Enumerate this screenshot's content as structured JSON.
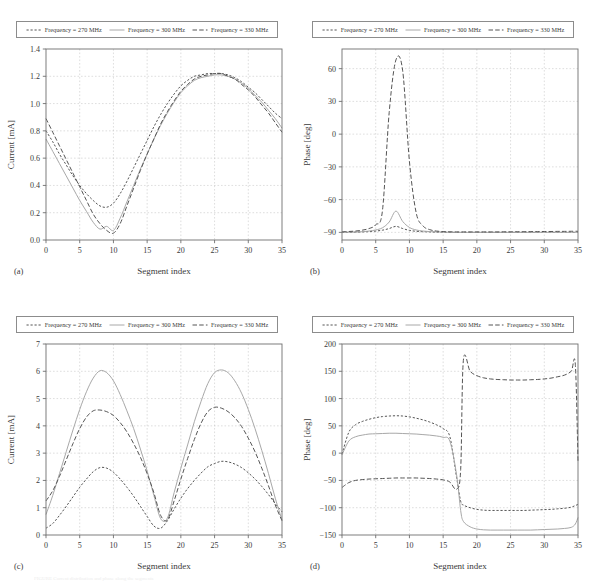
{
  "figure": {
    "panels": [
      {
        "id": "a",
        "caption": "(a)",
        "xlabel": "Segment index",
        "ylabel": "Current [mA]"
      },
      {
        "id": "b",
        "caption": "(b)",
        "xlabel": "Segment index",
        "ylabel": "Phase [deg]"
      },
      {
        "id": "c",
        "caption": "(c)",
        "xlabel": "Segment index",
        "ylabel": "Current [mA]"
      },
      {
        "id": "d",
        "caption": "(d)",
        "xlabel": "Segment index",
        "ylabel": "Phase [deg]"
      }
    ],
    "legend": {
      "entries": [
        {
          "label": "Frequency = 270 MHz",
          "style": "dotted",
          "color": "#555555"
        },
        {
          "label": "Frequency = 300 MHz",
          "style": "solid",
          "color": "#a8a8a8"
        },
        {
          "label": "Frequency = 330 MHz",
          "style": "dashdotted",
          "color": "#555555"
        }
      ]
    },
    "bottom_caption_partial": "FIGURE  Current distribution and phase along the segments"
  },
  "chart_data": [
    {
      "type": "line",
      "panel": "a",
      "title": "",
      "xlabel": "Segment index",
      "ylabel": "Current [mA]",
      "xlim": [
        0,
        35
      ],
      "ylim": [
        0.0,
        1.4
      ],
      "xticks": [
        0,
        5,
        10,
        15,
        20,
        25,
        30,
        35
      ],
      "yticks": [
        0.0,
        0.2,
        0.4,
        0.6,
        0.8,
        1.0,
        1.2,
        1.4
      ],
      "ytick_labels": [
        "0.0",
        "0.2",
        "0.4",
        "0.6",
        "0.8",
        "1.0",
        "1.2",
        "1.4"
      ],
      "grid": true,
      "legend_position": "above",
      "x": [
        0,
        1,
        2,
        3,
        4,
        5,
        6,
        7,
        8,
        9,
        10,
        11,
        12,
        13,
        14,
        15,
        16,
        17,
        18,
        19,
        20,
        21,
        22,
        23,
        24,
        25,
        26,
        27,
        28,
        29,
        30,
        31,
        32,
        33,
        34,
        35
      ],
      "series": [
        {
          "name": "Frequency = 270 MHz",
          "style": "dotted",
          "color": "#555555",
          "values": [
            0.8,
            0.72,
            0.63,
            0.55,
            0.47,
            0.4,
            0.34,
            0.29,
            0.25,
            0.24,
            0.27,
            0.34,
            0.43,
            0.53,
            0.63,
            0.73,
            0.83,
            0.92,
            1.0,
            1.07,
            1.13,
            1.17,
            1.2,
            1.21,
            1.22,
            1.22,
            1.22,
            1.21,
            1.19,
            1.16,
            1.12,
            1.08,
            1.03,
            0.98,
            0.93,
            0.89
          ]
        },
        {
          "name": "Frequency = 300 MHz",
          "style": "solid",
          "color": "#a8a8a8",
          "values": [
            0.74,
            0.65,
            0.56,
            0.47,
            0.38,
            0.29,
            0.21,
            0.13,
            0.08,
            0.1,
            0.07,
            0.16,
            0.28,
            0.4,
            0.52,
            0.63,
            0.74,
            0.84,
            0.93,
            1.01,
            1.08,
            1.13,
            1.17,
            1.19,
            1.2,
            1.21,
            1.21,
            1.2,
            1.18,
            1.15,
            1.11,
            1.06,
            1.01,
            0.95,
            0.89,
            0.82
          ]
        },
        {
          "name": "Frequency = 330 MHz",
          "style": "dashdotted",
          "color": "#555555",
          "values": [
            0.89,
            0.79,
            0.69,
            0.59,
            0.49,
            0.39,
            0.29,
            0.19,
            0.12,
            0.07,
            0.05,
            0.12,
            0.25,
            0.38,
            0.51,
            0.63,
            0.74,
            0.85,
            0.94,
            1.02,
            1.09,
            1.14,
            1.18,
            1.2,
            1.21,
            1.22,
            1.22,
            1.2,
            1.18,
            1.14,
            1.1,
            1.05,
            0.99,
            0.93,
            0.86,
            0.79
          ]
        }
      ]
    },
    {
      "type": "line",
      "panel": "b",
      "title": "",
      "xlabel": "Segment index",
      "ylabel": "Phase [deg]",
      "xlim": [
        0,
        35
      ],
      "ylim": [
        -97,
        78
      ],
      "xticks": [
        0,
        5,
        10,
        15,
        20,
        25,
        30,
        35
      ],
      "yticks": [
        -90,
        -60,
        -30,
        0,
        30,
        60
      ],
      "ytick_labels": [
        "−90",
        "−60",
        "−30",
        "0",
        "30",
        "60"
      ],
      "grid": true,
      "legend_position": "above",
      "x": [
        0,
        1,
        2,
        3,
        4,
        5,
        6,
        7,
        8,
        9,
        10,
        11,
        12,
        13,
        14,
        15,
        16,
        17,
        18,
        19,
        20,
        21,
        22,
        23,
        24,
        25,
        26,
        27,
        28,
        29,
        30,
        31,
        32,
        33,
        34,
        35
      ],
      "series": [
        {
          "name": "Frequency = 270 MHz",
          "style": "dotted",
          "color": "#555555",
          "values": [
            -90.0,
            -90.0,
            -89.8,
            -89.6,
            -89.3,
            -88.8,
            -88.0,
            -86.5,
            -84.5,
            -86.5,
            -88.2,
            -89.0,
            -89.4,
            -89.6,
            -89.8,
            -89.9,
            -90.0,
            -90.0,
            -90.0,
            -90.0,
            -90.0,
            -90.0,
            -90.0,
            -90.0,
            -90.0,
            -90.0,
            -90.0,
            -90.0,
            -90.0,
            -90.0,
            -90.0,
            -90.0,
            -90.0,
            -90.0,
            -90.0,
            -90.0
          ]
        },
        {
          "name": "Frequency = 300 MHz",
          "style": "solid",
          "color": "#a8a8a8",
          "values": [
            -90.0,
            -89.9,
            -89.7,
            -89.4,
            -88.8,
            -87.8,
            -85.8,
            -80.5,
            -70.5,
            -80.0,
            -85.5,
            -87.8,
            -88.8,
            -89.3,
            -89.6,
            -89.8,
            -89.9,
            -90.0,
            -90.0,
            -90.0,
            -90.0,
            -90.0,
            -90.0,
            -90.0,
            -90.0,
            -90.0,
            -90.0,
            -90.0,
            -90.0,
            -90.0,
            -90.0,
            -90.0,
            -90.0,
            -90.0,
            -90.0,
            -90.0
          ]
        },
        {
          "name": "Frequency = 330 MHz",
          "style": "dashdotted",
          "color": "#555555",
          "values": [
            -89.5,
            -89.2,
            -88.8,
            -88.0,
            -86.5,
            -83.0,
            -70.0,
            20.0,
            68.0,
            58.0,
            -25.0,
            -72.0,
            -84.0,
            -87.5,
            -88.8,
            -89.3,
            -89.5,
            -89.6,
            -89.6,
            -89.6,
            -89.6,
            -89.6,
            -89.6,
            -89.6,
            -89.5,
            -89.5,
            -89.4,
            -89.4,
            -89.3,
            -89.3,
            -89.2,
            -89.2,
            -89.1,
            -89.1,
            -89.0,
            -89.0
          ]
        }
      ]
    },
    {
      "type": "line",
      "panel": "c",
      "title": "",
      "xlabel": "Segment index",
      "ylabel": "Current [mA]",
      "xlim": [
        0,
        35
      ],
      "ylim": [
        0,
        7
      ],
      "xticks": [
        0,
        5,
        10,
        15,
        20,
        25,
        30,
        35
      ],
      "yticks": [
        0,
        1,
        2,
        3,
        4,
        5,
        6,
        7
      ],
      "ytick_labels": [
        "0",
        "1",
        "2",
        "3",
        "4",
        "5",
        "6",
        "7"
      ],
      "grid": true,
      "legend_position": "above",
      "x": [
        0,
        1,
        2,
        3,
        4,
        5,
        6,
        7,
        8,
        9,
        10,
        11,
        12,
        13,
        14,
        15,
        16,
        17,
        18,
        19,
        20,
        21,
        22,
        23,
        24,
        25,
        26,
        27,
        28,
        29,
        30,
        31,
        32,
        33,
        34,
        35
      ],
      "series": [
        {
          "name": "Frequency = 270 MHz",
          "style": "dotted",
          "color": "#555555",
          "values": [
            0.25,
            0.42,
            0.72,
            1.05,
            1.4,
            1.75,
            2.05,
            2.32,
            2.47,
            2.45,
            2.3,
            2.05,
            1.75,
            1.42,
            1.05,
            0.68,
            0.33,
            0.25,
            0.52,
            0.95,
            1.35,
            1.7,
            2.0,
            2.27,
            2.5,
            2.62,
            2.7,
            2.68,
            2.6,
            2.47,
            2.28,
            2.05,
            1.78,
            1.48,
            1.15,
            0.85
          ]
        },
        {
          "name": "Frequency = 300 MHz",
          "style": "solid",
          "color": "#a8a8a8",
          "values": [
            0.75,
            1.45,
            2.25,
            3.05,
            3.85,
            4.6,
            5.25,
            5.75,
            6.02,
            5.95,
            5.65,
            5.15,
            4.55,
            3.9,
            3.15,
            2.35,
            1.45,
            0.6,
            0.62,
            1.55,
            2.45,
            3.3,
            4.15,
            4.9,
            5.55,
            5.95,
            6.05,
            5.95,
            5.65,
            5.2,
            4.6,
            3.9,
            3.1,
            2.25,
            1.35,
            0.55
          ]
        },
        {
          "name": "Frequency = 330 MHz",
          "style": "dashdotted",
          "color": "#555555",
          "values": [
            1.25,
            1.62,
            2.15,
            2.75,
            3.35,
            3.9,
            4.32,
            4.55,
            4.58,
            4.52,
            4.38,
            4.12,
            3.78,
            3.35,
            2.85,
            2.25,
            1.55,
            0.72,
            0.55,
            1.25,
            2.05,
            2.8,
            3.5,
            4.1,
            4.52,
            4.68,
            4.65,
            4.52,
            4.3,
            3.98,
            3.55,
            3.05,
            2.45,
            1.8,
            1.1,
            0.52
          ]
        }
      ]
    },
    {
      "type": "line",
      "panel": "d",
      "title": "",
      "xlabel": "Segment index",
      "ylabel": "Phase [deg]",
      "xlim": [
        0,
        35
      ],
      "ylim": [
        -150,
        200
      ],
      "xticks": [
        0,
        5,
        10,
        15,
        20,
        25,
        30,
        35
      ],
      "yticks": [
        -150,
        -100,
        -50,
        0,
        50,
        100,
        150,
        200
      ],
      "ytick_labels": [
        "−150",
        "−100",
        "−50",
        "0",
        "50",
        "100",
        "150",
        "200"
      ],
      "grid": true,
      "legend_position": "above",
      "x": [
        0,
        1,
        2,
        3,
        4,
        5,
        6,
        7,
        8,
        9,
        10,
        11,
        12,
        13,
        14,
        15,
        16,
        17,
        17.6,
        18,
        19,
        20,
        21,
        22,
        23,
        24,
        25,
        26,
        27,
        28,
        29,
        30,
        31,
        32,
        33,
        34,
        34.6,
        35
      ],
      "series": [
        {
          "name": "Frequency = 270 MHz",
          "style": "dotted",
          "color": "#555555",
          "values": [
            -2.0,
            38.0,
            52.0,
            58.0,
            62.0,
            65.0,
            67.0,
            68.0,
            68.5,
            68.0,
            66.5,
            64.0,
            61.0,
            57.0,
            52.0,
            45.0,
            30.0,
            -45.0,
            -88.0,
            -95.0,
            -100.0,
            -103.0,
            -104.5,
            -105.0,
            -105.0,
            -105.0,
            -105.0,
            -105.0,
            -105.0,
            -104.5,
            -104.0,
            -103.5,
            -103.0,
            -102.0,
            -101.0,
            -99.0,
            -96.0,
            -94.0
          ]
        },
        {
          "name": "Frequency = 300 MHz",
          "style": "solid",
          "color": "#a8a8a8",
          "values": [
            -3.0,
            22.0,
            30.0,
            33.0,
            35.0,
            35.5,
            36.0,
            36.5,
            36.5,
            36.0,
            35.5,
            35.0,
            34.0,
            33.0,
            31.5,
            29.0,
            22.0,
            -40.0,
            -105.0,
            -125.0,
            -135.0,
            -139.0,
            -140.5,
            -141.0,
            -141.0,
            -141.0,
            -141.0,
            -141.0,
            -141.0,
            -141.0,
            -140.5,
            -140.0,
            -139.5,
            -139.0,
            -138.0,
            -136.0,
            -130.0,
            -118.0
          ]
        },
        {
          "name": "Frequency = 330 MHz",
          "style": "dashdotted",
          "color": "#555555",
          "values": [
            -63.0,
            -54.0,
            -50.0,
            -48.5,
            -47.5,
            -47.0,
            -46.5,
            -46.0,
            -45.5,
            -45.5,
            -45.5,
            -45.5,
            -46.0,
            -46.5,
            -47.5,
            -49.0,
            -53.0,
            -66.0,
            -30.0,
            170.0,
            150.0,
            142.0,
            138.0,
            136.0,
            135.0,
            134.5,
            134.0,
            134.0,
            134.0,
            134.5,
            135.0,
            136.0,
            137.5,
            140.0,
            143.0,
            150.0,
            163.0,
            -15.0
          ]
        }
      ]
    }
  ]
}
